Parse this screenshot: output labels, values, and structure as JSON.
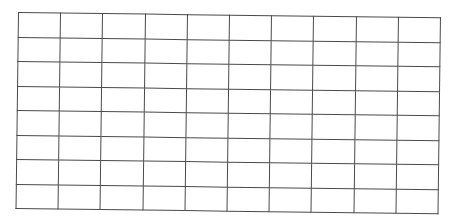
{
  "grid": {
    "rows": 8,
    "columns": 10,
    "line_color": "#4a4a4a",
    "background": "#ffffff",
    "cells": [
      [
        "",
        "",
        "",
        "",
        "",
        "",
        "",
        "",
        "",
        ""
      ],
      [
        "",
        "",
        "",
        "",
        "",
        "",
        "",
        "",
        "",
        ""
      ],
      [
        "",
        "",
        "",
        "",
        "",
        "",
        "",
        "",
        "",
        ""
      ],
      [
        "",
        "",
        "",
        "",
        "",
        "",
        "",
        "",
        "",
        ""
      ],
      [
        "",
        "",
        "",
        "",
        "",
        "",
        "",
        "",
        "",
        ""
      ],
      [
        "",
        "",
        "",
        "",
        "",
        "",
        "",
        "",
        "",
        ""
      ],
      [
        "",
        "",
        "",
        "",
        "",
        "",
        "",
        "",
        "",
        ""
      ],
      [
        "",
        "",
        "",
        "",
        "",
        "",
        "",
        "",
        "",
        ""
      ]
    ]
  }
}
